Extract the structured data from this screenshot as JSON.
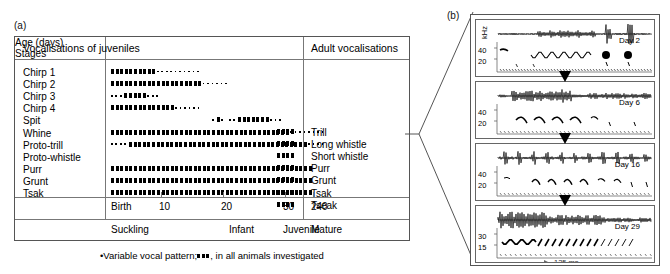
{
  "figure": {
    "panel_a_label": "(a)",
    "panel_b_label": "(b)",
    "footnote": "Variable vocal pattern;",
    "footnote_tail": ", in all animals investigated"
  },
  "table": {
    "header_left": "Vocalisations of juveniles",
    "header_right": "Adult vocalisations",
    "axis_title": "Age (days)",
    "stages_title": "Stages",
    "age_ticks": [
      {
        "label": "Birth",
        "x": 4
      },
      {
        "label": "10",
        "x": 52
      },
      {
        "label": "20",
        "x": 114
      },
      {
        "label": "30",
        "x": 176
      },
      {
        "label": "240",
        "x": 204
      }
    ],
    "stages": [
      {
        "label": "Suckling",
        "x": 4
      },
      {
        "label": "Infant",
        "x": 122
      },
      {
        "label": "Juvenile",
        "x": 176
      },
      {
        "label": "Mature",
        "x": 204
      }
    ],
    "juvenile_rows": [
      {
        "label": "Chirp 1",
        "start": 0,
        "solid": 10,
        "dots": 10
      },
      {
        "label": "Chirp 2",
        "start": 0,
        "solid": 20,
        "dots": 6
      },
      {
        "label": "Chirp 3",
        "start": 0,
        "solid": 0,
        "dots": 3,
        "solid2": 5,
        "dots2": 3
      },
      {
        "label": "Chirp 4",
        "start": 0,
        "solid": 14,
        "dots": 6
      },
      {
        "label": "Spit",
        "start": 22,
        "solid": 1,
        "dots": 0,
        "pre_dots": 1,
        "post_dots": 1
      },
      {
        "label": "Whine",
        "start": 0,
        "solid": 39,
        "dots": 8
      },
      {
        "label": "Proto-trill",
        "start": 0,
        "solid": 0,
        "dots": 4,
        "solid2": 39,
        "dots2": 4
      },
      {
        "label": "Proto-whistle",
        "start": 0,
        "solid": 0,
        "dots": 0
      },
      {
        "label": "Purr",
        "start": 0,
        "solid": 44,
        "dots": 0
      },
      {
        "label": "Grunt",
        "start": 0,
        "solid": 44,
        "dots": 0
      },
      {
        "label": "Tsak",
        "start": 0,
        "solid": 44,
        "dots": 0
      }
    ],
    "spit_extra": {
      "solid": 7,
      "dots_before": 2,
      "dots_after": 3,
      "start": 118
    },
    "adult_rows": [
      {
        "label": "Trill"
      },
      {
        "label": "Long whistle"
      },
      {
        "label": "Short whistle"
      },
      {
        "label": "Purr"
      },
      {
        "label": "Grunt"
      },
      {
        "label": "Tsak"
      },
      {
        "label": "Tseak"
      }
    ]
  },
  "spectrograms": {
    "y_axis_unit": "kHz",
    "scalebar": "125 ms",
    "panels": [
      {
        "day": "Day 2",
        "ticks": [
          "40",
          "20"
        ]
      },
      {
        "day": "Day 6",
        "ticks": [
          "40",
          "20"
        ]
      },
      {
        "day": "Day 16",
        "ticks": [
          "40",
          "20"
        ]
      },
      {
        "day": "Day 29",
        "ticks": [
          "30",
          "15"
        ]
      }
    ]
  },
  "colors": {
    "ink": "#000000",
    "rule": "#777777",
    "background": "#ffffff"
  }
}
